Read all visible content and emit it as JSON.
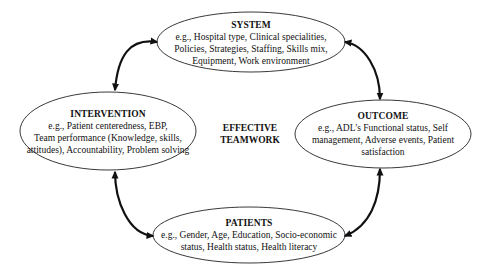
{
  "diagram": {
    "center_label": [
      "EFFECTIVE",
      "TEAMWORK"
    ],
    "nodes": {
      "system": {
        "title": "SYSTEM",
        "lines": [
          "e.g., Hospital type, Clinical specialities,",
          "Policies, Strategies, Staffing, Skills mix,",
          "Equipment, Work environment"
        ]
      },
      "intervention": {
        "title": "INTERVENTION",
        "lines": [
          "e.g., Patient centeredness, EBP,",
          "Team performance (Knowledge, skills,",
          "attitudes), Accountability, Problem solving"
        ]
      },
      "outcome": {
        "title": "OUTCOME",
        "lines": [
          "e.g., ADL's Functional status, Self",
          "management, Adverse events, Patient",
          "satisfaction"
        ]
      },
      "patients": {
        "title": "PATIENTS",
        "lines": [
          "e.g., Gender, Age, Education, Socio-economic",
          "status, Health status, Health literacy"
        ]
      }
    },
    "edges": [
      {
        "from": "intervention",
        "to": "system",
        "type": "bidirectional"
      },
      {
        "from": "system",
        "to": "outcome",
        "type": "bidirectional"
      },
      {
        "from": "intervention",
        "to": "patients",
        "type": "bidirectional"
      },
      {
        "from": "outcome",
        "to": "patients",
        "type": "bidirectional"
      }
    ],
    "colors": {
      "stroke": "#111111",
      "fill": "#ffffff",
      "text": "#111111"
    }
  }
}
